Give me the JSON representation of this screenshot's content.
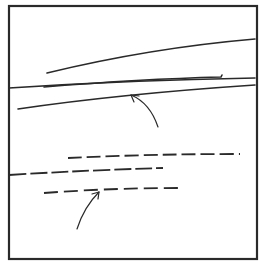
{
  "figure": {
    "width": 262,
    "height": 268,
    "background": "#ffffff",
    "ink": "#2a2a2a",
    "frame": {
      "x": 9,
      "y": 6,
      "w": 248,
      "h": 253,
      "stroke_width": 2.2
    },
    "solid_lines": [
      {
        "name": "upper-long-line",
        "d": "M47,73 Q150,48 255,39"
      },
      {
        "name": "middle-short-line",
        "d": "M44,87 Q140,79 221,77 L222,75"
      },
      {
        "name": "frame-crossing-line",
        "d": "M9,88 Q130,80 255,78"
      },
      {
        "name": "lower-solid-line",
        "d": "M18,109 Q120,94 255,85"
      }
    ],
    "dashed_lines": [
      {
        "name": "upper-dashed-line",
        "d": "M68,158 Q150,154 240,154",
        "dash": "14 5"
      },
      {
        "name": "middle-dashed-line",
        "d": "M9,175 Q90,170 163,168",
        "dash": "17 4"
      },
      {
        "name": "lower-dashed-line",
        "d": "M44,193 Q110,188 178,188",
        "dash": "14 6"
      }
    ],
    "arrows": [
      {
        "name": "upper-arrow",
        "d": "M158,127 Q150,103 131,95",
        "head": "M131,95 L139,96 M131,95 L134,102"
      },
      {
        "name": "lower-arrow",
        "d": "M77,229 Q84,207 99,192",
        "head": "M99,192 L92,194 M99,192 L98,199"
      }
    ]
  }
}
